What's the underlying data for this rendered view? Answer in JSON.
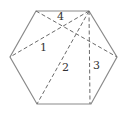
{
  "diagram": {
    "shape": "regular hexagon",
    "stroke_color": "#8a8a8a",
    "dash_color": "#6a6a6a",
    "vertices": [
      {
        "name": "top-left",
        "x": 36,
        "y": 11
      },
      {
        "name": "top-right",
        "x": 89,
        "y": 11
      },
      {
        "name": "right",
        "x": 117,
        "y": 57
      },
      {
        "name": "bottom-right",
        "x": 91,
        "y": 104
      },
      {
        "name": "bottom-left",
        "x": 37,
        "y": 104
      },
      {
        "name": "left",
        "x": 10,
        "y": 57
      }
    ],
    "diagonals": [
      {
        "label": "1",
        "from": "top-right",
        "to": "left"
      },
      {
        "label": "2",
        "from": "top-right",
        "to": "bottom-left"
      },
      {
        "label": "3",
        "from": "top-right",
        "to": "bottom-right"
      },
      {
        "label": "4",
        "from": "top-left",
        "to": "right"
      }
    ],
    "labels": [
      {
        "text": "1",
        "x": 40,
        "y": 51
      },
      {
        "text": "2",
        "x": 62,
        "y": 71
      },
      {
        "text": "3",
        "x": 93,
        "y": 69
      },
      {
        "text": "4",
        "x": 57,
        "y": 20
      }
    ]
  }
}
